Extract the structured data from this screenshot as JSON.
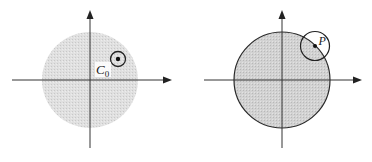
{
  "figure": {
    "panels": [
      {
        "id": "left",
        "label_main": "C",
        "label_sub": "0",
        "disc": {
          "fill": "#d9d9d9",
          "outlined": false
        },
        "small_circle": {
          "has_center_dot": true
        }
      },
      {
        "id": "right",
        "label_point": "P",
        "disc": {
          "fill": "#cfcfcf",
          "outlined": true
        },
        "small_circle": {
          "has_center_dot": true
        }
      }
    ],
    "colors": {
      "axis": "#333333",
      "outline": "#2a2a2a",
      "background": "#ffffff"
    }
  }
}
